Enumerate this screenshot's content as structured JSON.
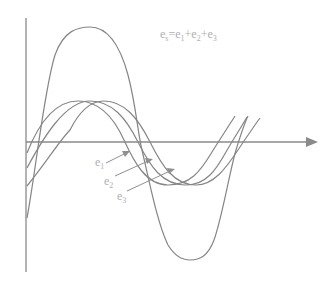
{
  "diagram": {
    "title_formula": {
      "lhs": "e",
      "lhs_sub": "s",
      "eq": "=",
      "terms": [
        {
          "base": "e",
          "sub": "1"
        },
        {
          "base": "e",
          "sub": "2"
        },
        {
          "base": "e",
          "sub": "3"
        }
      ],
      "plus": "+"
    },
    "curve_labels": [
      {
        "base": "e",
        "sub": "1"
      },
      {
        "base": "e",
        "sub": "2"
      },
      {
        "base": "e",
        "sub": "3"
      }
    ],
    "colors": {
      "curve": "#808080",
      "axis": "#808080",
      "label": "#b0b0b0"
    }
  }
}
